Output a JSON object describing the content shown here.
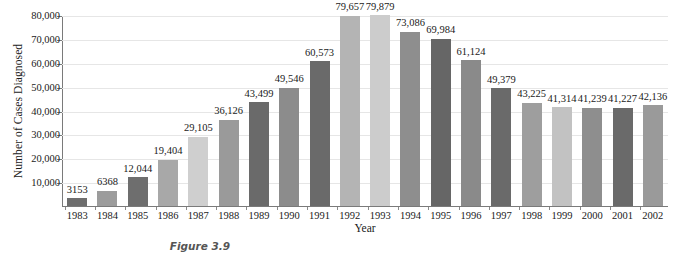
{
  "chart_data": {
    "type": "bar",
    "title": "",
    "xlabel": "Year",
    "ylabel": "Number of Cases Diagnosed",
    "ylim": [
      0,
      80000
    ],
    "ytick_labels": [
      "10,000",
      "20,000",
      "30,000",
      "40,000",
      "50,000",
      "60,000",
      "70,000",
      "80,000"
    ],
    "ytick_values": [
      10000,
      20000,
      30000,
      40000,
      50000,
      60000,
      70000,
      80000
    ],
    "grid": true,
    "legend": "none",
    "categories": [
      "1983",
      "1984",
      "1985",
      "1986",
      "1987",
      "1988",
      "1989",
      "1990",
      "1991",
      "1992",
      "1993",
      "1994",
      "1995",
      "1996",
      "1997",
      "1998",
      "1999",
      "2000",
      "2001",
      "2002"
    ],
    "values": [
      3153,
      6368,
      12044,
      19404,
      29105,
      36126,
      43499,
      49546,
      60573,
      79657,
      79879,
      73086,
      69984,
      61124,
      49379,
      43225,
      41314,
      41239,
      41227,
      42136
    ],
    "data_labels": [
      "3153",
      "6368",
      "12,044",
      "19,404",
      "29,105",
      "36,126",
      "43,499",
      "49,546",
      "60,573",
      "79,657",
      "79,879",
      "73,086",
      "69,984",
      "61,124",
      "49,379",
      "43,225",
      "41,314",
      "41,239",
      "41,227",
      "42,136"
    ],
    "bar_colors": [
      "#6e6e6e",
      "#9c9c9c",
      "#6e6e6e",
      "#a8a8a8",
      "#cfcfcf",
      "#9a9a9a",
      "#6a6a6a",
      "#8c8c8c",
      "#6a6a6a",
      "#b4b4b4",
      "#cccccc",
      "#8e8e8e",
      "#666666",
      "#8a8a8a",
      "#6a6a6a",
      "#9e9e9e",
      "#c2c2c2",
      "#8e8e8e",
      "#6a6a6a",
      "#9a9a9a"
    ]
  },
  "caption": {
    "text": "Figure 3.9"
  }
}
